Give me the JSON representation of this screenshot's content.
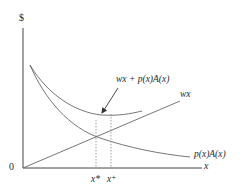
{
  "diagram": {
    "type": "economics-cost-curves",
    "y_axis_label": "$",
    "x_axis_label": "x",
    "origin_label": "0",
    "curves": [
      {
        "id": "total",
        "label": "wx + p(x)A(x)",
        "shape": "u-shaped"
      },
      {
        "id": "linear",
        "label": "wx",
        "shape": "straight line from origin"
      },
      {
        "id": "expected_loss",
        "label": "p(x)A(x)",
        "shape": "decreasing convex"
      }
    ],
    "markers": [
      {
        "id": "x_star",
        "label": "x*",
        "note": "intersection of wx and p(x)A(x)"
      },
      {
        "id": "x_plus",
        "label": "x⁺",
        "note": "minimum of total curve"
      }
    ],
    "annotation_arrow": {
      "points_to": "minimum of wx + p(x)A(x)"
    },
    "colors": {
      "line": "#555555",
      "text": "#2a2a2a",
      "background": "#ffffff"
    }
  }
}
